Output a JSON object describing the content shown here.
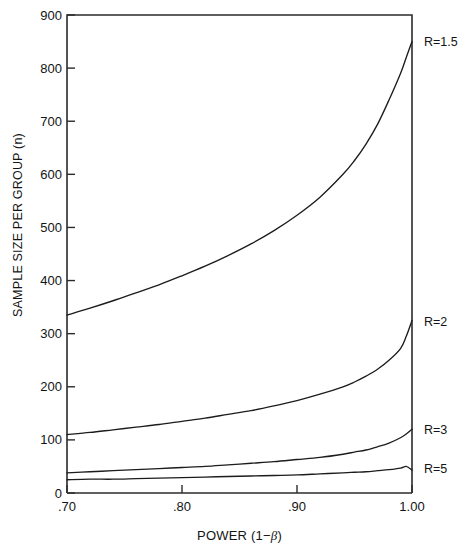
{
  "chart_data": {
    "type": "line",
    "title": "",
    "xlabel": "POWER (1−β)",
    "ylabel": "SAMPLE SIZE PER GROUP (n)",
    "xlim": [
      0.7,
      1.0
    ],
    "ylim": [
      0,
      900
    ],
    "grid": false,
    "legend_position": "right-inline-annotations",
    "xticks": [
      0.7,
      0.8,
      0.9,
      1.0
    ],
    "xtick_labels": [
      ".70",
      ".80",
      ".90",
      "1.00"
    ],
    "yticks": [
      0,
      100,
      200,
      300,
      400,
      500,
      600,
      700,
      800,
      900
    ],
    "ytick_labels": [
      "0",
      "100",
      "200",
      "300",
      "400",
      "500",
      "600",
      "700",
      "800",
      "900"
    ],
    "x": [
      0.7,
      0.72,
      0.74,
      0.76,
      0.78,
      0.8,
      0.82,
      0.84,
      0.86,
      0.88,
      0.9,
      0.92,
      0.94,
      0.95,
      0.96,
      0.97,
      0.98,
      0.99,
      0.995,
      1.0
    ],
    "series": [
      {
        "name": "R=1.5",
        "label": "R=1.5",
        "values": [
          335,
          348,
          362,
          377,
          392,
          409,
          427,
          447,
          469,
          494,
          523,
          557,
          600,
          626,
          657,
          694,
          740,
          790,
          820,
          850
        ]
      },
      {
        "name": "R=2",
        "label": "R=2",
        "values": [
          110,
          114,
          119,
          124,
          129,
          135,
          141,
          148,
          155,
          164,
          174,
          186,
          200,
          209,
          220,
          233,
          250,
          272,
          295,
          325
        ]
      },
      {
        "name": "R=3",
        "label": "R=3",
        "values": [
          38,
          40,
          42,
          44,
          46,
          48,
          50,
          53,
          56,
          59,
          63,
          67,
          73,
          77,
          81,
          87,
          94,
          104,
          111,
          120
        ]
      },
      {
        "name": "R=5",
        "label": "R=5",
        "values": [
          25,
          26,
          26,
          27,
          28,
          29,
          30,
          31,
          32,
          33,
          34,
          36,
          38,
          39,
          40,
          42,
          44,
          47,
          50,
          43
        ]
      }
    ]
  },
  "annotations": {
    "series_labels": [
      {
        "text": "R=1.5",
        "top": 36
      },
      {
        "text": "R=2",
        "top": 316
      },
      {
        "text": "R=3",
        "top": 424
      },
      {
        "text": "R=5",
        "top": 463
      }
    ]
  }
}
